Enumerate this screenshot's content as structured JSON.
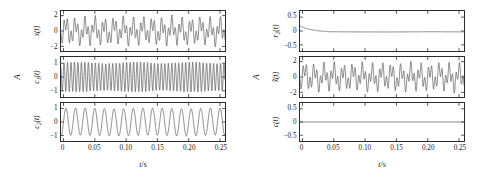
{
  "figure": {
    "background": "#ffffff",
    "line_color": "#4d4d4d",
    "axis_color": "#2b2b2b"
  },
  "panels": {
    "left": {
      "amplitude_axis_label": "A",
      "x_axis_label_value": "t",
      "x_axis_label_unit": "/s",
      "x_ticks": [
        "0",
        "0.05",
        "0.10",
        "0.15",
        "0.20",
        "0.25"
      ],
      "x_tick_values": [
        0,
        0.05,
        0.1,
        0.15,
        0.2,
        0.25
      ],
      "xlim": [
        -0.004,
        0.258
      ],
      "subplots": [
        {
          "name": "x(t)",
          "name_base": "x",
          "name_sub": "",
          "y_ticks": [
            "2",
            "0",
            "-2"
          ],
          "y_tick_values": [
            2,
            0,
            -2
          ],
          "ylim": [
            -2.6,
            2.6
          ]
        },
        {
          "name": "c1(t)",
          "name_base": "c",
          "name_sub": "1",
          "y_ticks": [
            "1",
            "0",
            "-1"
          ],
          "y_tick_values": [
            1,
            0,
            -1
          ],
          "ylim": [
            -1.45,
            1.45
          ]
        },
        {
          "name": "c2(t)",
          "name_base": "c",
          "name_sub": "2",
          "y_ticks": [
            "1",
            "0",
            "-1"
          ],
          "y_tick_values": [
            1,
            0,
            -1
          ],
          "ylim": [
            -1.4,
            1.4
          ]
        }
      ]
    },
    "right": {
      "amplitude_axis_label": "A",
      "x_axis_label_value": "t",
      "x_axis_label_unit": "/s",
      "x_ticks": [
        "0",
        "0.05",
        "0.10",
        "0.15",
        "0.20",
        "0.25"
      ],
      "x_tick_values": [
        0,
        0.05,
        0.1,
        0.15,
        0.2,
        0.25
      ],
      "xlim": [
        -0.004,
        0.258
      ],
      "subplots": [
        {
          "name": "r2(t)",
          "name_base": "r",
          "name_sub": "2",
          "y_ticks": [
            "0.5",
            "0",
            "-0.5"
          ],
          "y_tick_values": [
            0.5,
            0,
            -0.5
          ],
          "ylim": [
            -0.72,
            0.72
          ]
        },
        {
          "name": "x~(t)",
          "name_base": "x",
          "name_sub": "",
          "y_ticks": [
            "2",
            "0",
            "-2"
          ],
          "y_tick_values": [
            2,
            0,
            -2
          ],
          "ylim": [
            -2.6,
            2.6
          ]
        },
        {
          "name": "c(t)",
          "name_base": "c",
          "name_sub": "",
          "y_ticks": [
            "0.5",
            "0",
            "-0.5"
          ],
          "y_tick_values": [
            0.5,
            0,
            -0.5
          ],
          "ylim": [
            -0.72,
            0.72
          ]
        }
      ]
    }
  },
  "chart_data": {
    "type": "line",
    "title": "",
    "xlabel": "t/s",
    "ylabel": "A",
    "grid": false,
    "legend": "none",
    "charts": [
      {
        "panel": "left",
        "index": 0,
        "name": "x(t)",
        "ylabel": "x(t)",
        "xlim": [
          0,
          0.26
        ],
        "ylim": [
          -2.6,
          2.6
        ],
        "yticks": [
          2,
          0,
          -2
        ],
        "xticks": [
          0,
          0.05,
          0.1,
          0.15,
          0.2,
          0.25
        ],
        "signal": "sum of two sinusoids: 1.0*sin(2*pi*65*t) + 0.95*sin(2*pi*180*t) plus small modulation; amplitude envelope approximately +/-2",
        "components": [
          {
            "amplitude": 1.0,
            "frequency_hz": 65,
            "phase": 0
          },
          {
            "amplitude": 0.95,
            "frequency_hz": 180,
            "phase": 0.6
          }
        ]
      },
      {
        "panel": "left",
        "index": 1,
        "name": "c1(t)",
        "ylabel": "c1(t)",
        "xlim": [
          0,
          0.26
        ],
        "ylim": [
          -1.45,
          1.45
        ],
        "yticks": [
          1,
          0,
          -1
        ],
        "xticks": [
          0,
          0.05,
          0.1,
          0.15,
          0.2,
          0.25
        ],
        "signal": "high frequency intrinsic mode, approximately 180 Hz sinusoid, amplitude ~1",
        "components": [
          {
            "amplitude": 1.0,
            "frequency_hz": 180,
            "phase": 0.6
          }
        ]
      },
      {
        "panel": "left",
        "index": 2,
        "name": "c2(t)",
        "ylabel": "c2(t)",
        "xlim": [
          0,
          0.26
        ],
        "ylim": [
          -1.4,
          1.4
        ],
        "yticks": [
          1,
          0,
          -1
        ],
        "xticks": [
          0,
          0.05,
          0.1,
          0.15,
          0.2,
          0.25
        ],
        "signal": "low frequency intrinsic mode, approximately 65 Hz sinusoid, amplitude ~1",
        "components": [
          {
            "amplitude": 1.0,
            "frequency_hz": 65,
            "phase": 0
          }
        ]
      },
      {
        "panel": "right",
        "index": 0,
        "name": "r2(t)",
        "ylabel": "r2(t)",
        "xlim": [
          0,
          0.26
        ],
        "ylim": [
          -0.72,
          0.72
        ],
        "yticks": [
          0.5,
          0,
          -0.5
        ],
        "xticks": [
          0,
          0.05,
          0.1,
          0.15,
          0.2,
          0.25
        ],
        "signal": "residual: starts near 0.14 at t=0, decays to approximately -0.03 by t=0.04 s, then remains flat near zero",
        "components": []
      },
      {
        "panel": "right",
        "index": 1,
        "name": "x~(t)",
        "ylabel": "x~(t)",
        "xlim": [
          0,
          0.26
        ],
        "ylim": [
          -2.6,
          2.6
        ],
        "yticks": [
          2,
          0,
          -2
        ],
        "xticks": [
          0,
          0.05,
          0.1,
          0.15,
          0.2,
          0.25
        ],
        "signal": "reconstructed signal, nearly identical to x(t): sum of 65 Hz and 180 Hz sinusoids, amplitude ~2",
        "components": [
          {
            "amplitude": 1.0,
            "frequency_hz": 65,
            "phase": 0
          },
          {
            "amplitude": 0.95,
            "frequency_hz": 180,
            "phase": 0.6
          }
        ]
      },
      {
        "panel": "right",
        "index": 2,
        "name": "c(t)",
        "ylabel": "c(t)",
        "xlim": [
          0,
          0.26
        ],
        "ylim": [
          -0.72,
          0.72
        ],
        "yticks": [
          0.5,
          0,
          -0.5
        ],
        "xticks": [
          0,
          0.05,
          0.1,
          0.15,
          0.2,
          0.25
        ],
        "signal": "reconstruction error, flat at zero across the whole time range",
        "components": []
      }
    ]
  }
}
